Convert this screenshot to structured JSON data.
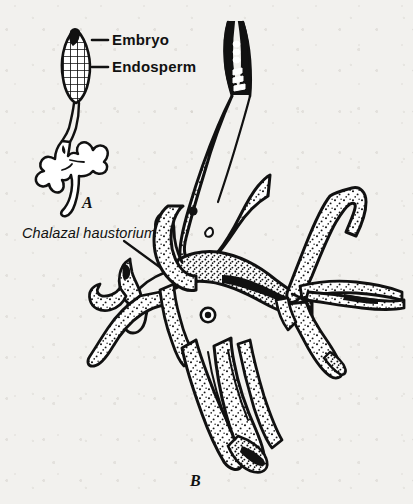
{
  "figure": {
    "kind": "botanical-line-drawing",
    "background_color": "#f2f1ee",
    "ink_color": "#111111",
    "labels": {
      "embryo": "Embryo",
      "endosperm": "Endosperm",
      "chalazal_haustorium": "Chalazal haustorium"
    },
    "panels": [
      {
        "letter": "A",
        "x": 88,
        "y": 204
      },
      {
        "letter": "B",
        "x": 196,
        "y": 482
      }
    ],
    "callouts": [
      {
        "target": "embryo",
        "label_x": 112,
        "label_y": 45,
        "leader_from_x": 108,
        "leader_from_y": 40,
        "leader_to_x": 92,
        "leader_to_y": 40
      },
      {
        "target": "endosperm",
        "label_x": 112,
        "label_y": 72,
        "leader_from_x": 108,
        "leader_from_y": 67,
        "leader_to_x": 92,
        "leader_to_y": 67
      },
      {
        "target": "chalazal_haustorium",
        "label_x": 22,
        "label_y": 237,
        "leader_from_x": 124,
        "leader_from_y": 241,
        "leader_to_x": 161,
        "leader_to_y": 268
      }
    ]
  }
}
